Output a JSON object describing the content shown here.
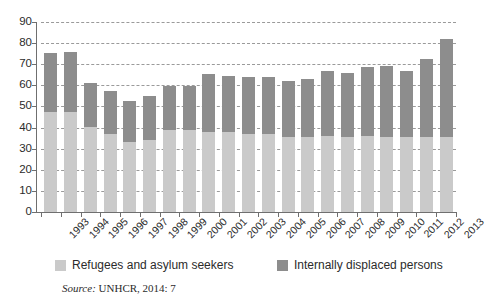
{
  "chart_data": {
    "type": "bar",
    "stacked": true,
    "title": "",
    "subtitle": "",
    "xlabel": "",
    "ylabel": "",
    "ylim": [
      0,
      90
    ],
    "ytick_step": 10,
    "yticks": [
      0,
      10,
      20,
      30,
      40,
      50,
      60,
      70,
      80,
      90
    ],
    "grid": true,
    "grid_style": "dashed-horizontal",
    "legend_position": "bottom",
    "categories": [
      "1993",
      "1994",
      "1995",
      "1996",
      "1997",
      "1998",
      "1999",
      "2000",
      "2001",
      "2002",
      "2003",
      "2004",
      "2005",
      "2006",
      "2007",
      "2008",
      "2009",
      "2010",
      "2011",
      "2012",
      "2013"
    ],
    "series": [
      {
        "name": "Refugees and asylum seekers",
        "color": "#cacaca",
        "values": [
          47.5,
          47.5,
          40.5,
          37.0,
          33.0,
          34.0,
          39.0,
          39.0,
          38.0,
          38.0,
          37.0,
          37.0,
          35.5,
          35.5,
          36.0,
          35.5,
          36.0,
          35.5,
          35.5,
          35.5,
          35.5
        ]
      },
      {
        "name": "Internally displaced persons",
        "color": "#8d8d8d",
        "values": [
          28.0,
          28.5,
          20.5,
          20.5,
          19.5,
          21.0,
          20.5,
          20.5,
          27.5,
          26.5,
          27.0,
          27.0,
          26.5,
          27.5,
          31.0,
          30.5,
          32.5,
          33.5,
          31.5,
          37.0,
          46.5
        ]
      }
    ],
    "totals": [
      75.5,
      76.0,
      61.0,
      57.5,
      52.5,
      55.0,
      59.5,
      59.5,
      65.5,
      64.5,
      64.0,
      64.0,
      62.0,
      63.0,
      67.0,
      66.0,
      68.5,
      69.0,
      67.0,
      72.5,
      82.0
    ]
  },
  "legend": {
    "items": [
      {
        "label": "Refugees and asylum seekers",
        "color": "#cacaca"
      },
      {
        "label": "Internally displaced persons",
        "color": "#8d8d8d"
      }
    ]
  },
  "source_note": {
    "prefix": "Source:",
    "text": " UNHCR, 2014: 7",
    "full": "Source: UNHCR, 2014: 7"
  },
  "colors": {
    "light_gray": "#cacaca",
    "dark_gray": "#8d8d8d",
    "axis": "#6f6f6f",
    "grid": "#9a9a9a",
    "text": "#2b2b2b",
    "background": "#ffffff"
  }
}
